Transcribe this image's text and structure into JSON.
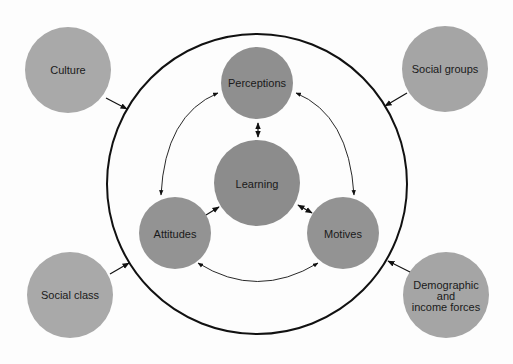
{
  "diagram": {
    "type": "concept-diagram",
    "colors": {
      "external_node": "#a9a9a9",
      "internal_node": "#8f8f8f",
      "stroke": "#111111",
      "background": "#fdfdfd"
    },
    "boundary": {
      "cx": 257,
      "cy": 184,
      "r": 150
    },
    "external_nodes": [
      {
        "id": "culture",
        "label": "Culture",
        "cx": 68,
        "cy": 70,
        "r": 43
      },
      {
        "id": "social-groups",
        "label": "Social groups",
        "cx": 445,
        "cy": 69,
        "r": 43
      },
      {
        "id": "social-class",
        "label": "Social class",
        "cx": 70,
        "cy": 295,
        "r": 43
      },
      {
        "id": "demographic",
        "label": "Demographic and income forces",
        "lines": [
          "Demographic",
          "and",
          "income forces"
        ],
        "cx": 446,
        "cy": 295,
        "r": 43
      }
    ],
    "internal_nodes": [
      {
        "id": "perceptions",
        "label": "Perceptions",
        "cx": 257,
        "cy": 83,
        "r": 36
      },
      {
        "id": "learning",
        "label": "Learning",
        "cx": 257,
        "cy": 183,
        "r": 43
      },
      {
        "id": "attitudes",
        "label": "Attitudes",
        "cx": 175,
        "cy": 233,
        "r": 36
      },
      {
        "id": "motives",
        "label": "Motives",
        "cx": 343,
        "cy": 233,
        "r": 36
      }
    ],
    "edges": [
      {
        "from": "culture",
        "to": "boundary",
        "arrow": "end"
      },
      {
        "from": "social-groups",
        "to": "boundary",
        "arrow": "end"
      },
      {
        "from": "social-class",
        "to": "boundary",
        "arrow": "end"
      },
      {
        "from": "demographic",
        "to": "boundary",
        "arrow": "end"
      },
      {
        "from": "perceptions",
        "to": "learning",
        "arrow": "both"
      },
      {
        "from": "learning",
        "to": "motives",
        "arrow": "both"
      },
      {
        "from": "attitudes",
        "to": "learning",
        "arrow": "end"
      },
      {
        "from": "perceptions",
        "to": "attitudes",
        "arrow": "both",
        "curve": "arc"
      },
      {
        "from": "perceptions",
        "to": "motives",
        "arrow": "both",
        "curve": "arc"
      },
      {
        "from": "attitudes",
        "to": "motives",
        "arrow": "both",
        "curve": "arc"
      }
    ]
  }
}
